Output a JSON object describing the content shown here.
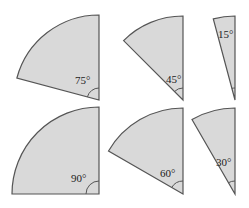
{
  "diagram": {
    "fill_color": "#d9d9d9",
    "stroke_color": "#555555",
    "sectors": [
      {
        "label": "75°",
        "angle": 75
      },
      {
        "label": "45°",
        "angle": 45
      },
      {
        "label": "15°",
        "angle": 15
      },
      {
        "label": "90°",
        "angle": 90
      },
      {
        "label": "60°",
        "angle": 60
      },
      {
        "label": "30°",
        "angle": 30
      }
    ]
  }
}
